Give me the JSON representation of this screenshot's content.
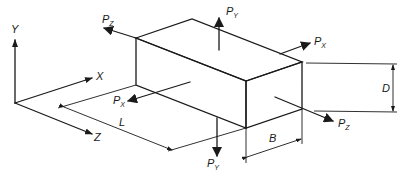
{
  "diagram": {
    "axes": {
      "x_label": "X",
      "y_label": "Y",
      "z_label": "Z"
    },
    "dimensions": {
      "length": "L",
      "breadth": "B",
      "depth": "D"
    },
    "forces": {
      "py_top": {
        "base": "P",
        "sub": "Y"
      },
      "py_bottom": {
        "base": "P",
        "sub": "Y"
      },
      "px_right": {
        "base": "P",
        "sub": "X"
      },
      "px_left": {
        "base": "P",
        "sub": "X"
      },
      "pz_left": {
        "base": "P",
        "sub": "Z"
      },
      "pz_right": {
        "base": "P",
        "sub": "Z"
      }
    },
    "colors": {
      "ink": "#1a1a1a",
      "background": "#ffffff"
    }
  }
}
